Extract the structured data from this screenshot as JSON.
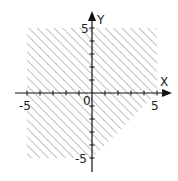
{
  "chart_data": {
    "type": "region",
    "title": "",
    "xlabel": "X",
    "ylabel": "Y",
    "xlim": [
      -6,
      6
    ],
    "ylim": [
      -6,
      6
    ],
    "grid": false,
    "tick_labels": {
      "x": [
        "-5",
        "5"
      ],
      "y": [
        "5",
        "-5"
      ],
      "origin": "0"
    },
    "ticks": [
      -5,
      -4,
      -3,
      -2,
      -1,
      1,
      2,
      3,
      4,
      5
    ],
    "shaded_region": {
      "description": "Hatched region: -5 <= x <= 5, -5 <= y <= 5, y >= x - 5",
      "vertices": [
        [
          -5,
          5
        ],
        [
          5,
          5
        ],
        [
          5,
          0
        ],
        [
          0,
          -5
        ],
        [
          -5,
          -5
        ]
      ],
      "fill": "diagonal-hatch",
      "boundary_line": "y = x - 5"
    }
  },
  "colors": {
    "axis": "#111111",
    "hatch": "#8a8a8a",
    "background": "#ffffff"
  }
}
